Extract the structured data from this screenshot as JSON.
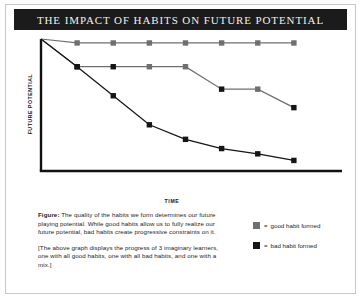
{
  "title": "THE IMPACT OF HABITS ON FUTURE POTENTIAL",
  "chart_data": {
    "type": "line",
    "title": "THE IMPACT OF HABITS ON FUTURE POTENTIAL",
    "xlabel": "TIME",
    "ylabel": "FUTURE POTENTIAL",
    "xlim": [
      0,
      8
    ],
    "ylim": [
      0,
      100
    ],
    "grid": false,
    "legend_position": "bottom-right",
    "x": [
      1,
      2,
      3,
      4,
      5,
      6,
      7
    ],
    "series": [
      {
        "name": "all good habits",
        "values": [
          97,
          97,
          97,
          97,
          97,
          97,
          97
        ],
        "marker_types": [
          "good",
          "good",
          "good",
          "good",
          "good",
          "good",
          "good"
        ],
        "color": "#6f6f6f"
      },
      {
        "name": "mix of habits",
        "values": [
          79,
          79,
          79,
          79,
          62,
          62,
          48
        ],
        "marker_types": [
          "bad",
          "bad",
          "good",
          "good",
          "bad",
          "good",
          "bad"
        ],
        "color": "#6f6f6f"
      },
      {
        "name": "all bad habits",
        "values": [
          79,
          57,
          35,
          24,
          17,
          13,
          8
        ],
        "marker_types": [
          "bad",
          "bad",
          "bad",
          "bad",
          "bad",
          "bad",
          "bad"
        ],
        "color": "#151515"
      }
    ],
    "origin_value": 100,
    "annotations": []
  },
  "legend": {
    "equals": "=",
    "items": [
      {
        "label": "good habit formed",
        "color": "#6f6f6f",
        "marker": "good"
      },
      {
        "label": "bad habit formed",
        "color": "#151515",
        "marker": "bad"
      }
    ]
  },
  "caption": {
    "figure_word": "Figure:",
    "paragraph1": " The quality of the habits we form determines our future playing potential. While good habits allow us to fully realize our future potential, bad habits create progressive constraints on it.",
    "paragraph2": "[The above graph displays the progress of 3 imaginary learners, one with all good habits, one with all bad habits, and one with a mix.]"
  }
}
